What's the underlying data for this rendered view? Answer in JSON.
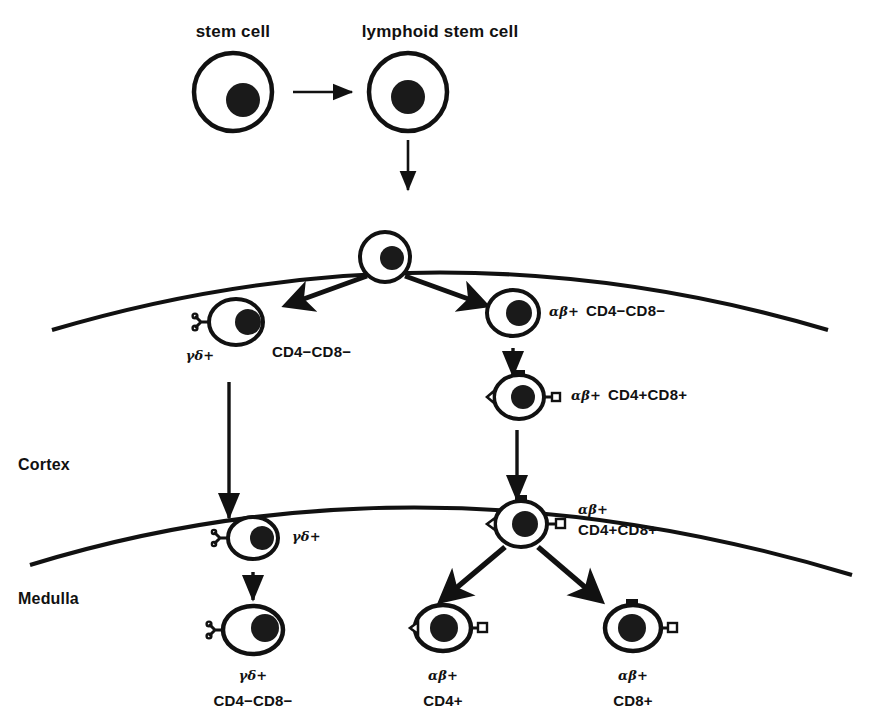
{
  "figure": {
    "title_top_left": "stem cell",
    "title_top_right": "lymphoid stem cell",
    "regions": {
      "cortex": "Cortex",
      "medulla": "Medulla"
    }
  },
  "cells": {
    "stem_cell": {
      "label": "stem cell",
      "markers": []
    },
    "lymphoid_stem_cell": {
      "label": "lymphoid stem cell",
      "markers": []
    },
    "thymic_progenitor": {
      "label": "",
      "markers": []
    },
    "cortex_gd": {
      "receptor": "γδ+",
      "phenotype": "CD4−CD8−"
    },
    "cortex_ab_dn": {
      "receptor": "αβ+",
      "phenotype": "CD4−CD8−"
    },
    "cortex_ab_dp": {
      "receptor": "αβ+",
      "phenotype": "CD4+CD8+"
    },
    "medulla_gd": {
      "receptor": "γδ+",
      "phenotype": ""
    },
    "medulla_ab_dp": {
      "receptor": "αβ+",
      "phenotype": "CD4+CD8+"
    },
    "final_gd": {
      "receptor": "γδ+",
      "phenotype": "CD4−CD8−"
    },
    "final_cd4": {
      "receptor": "αβ+",
      "phenotype": "CD4+"
    },
    "final_cd8": {
      "receptor": "αβ+",
      "phenotype": "CD8+"
    }
  },
  "colors": {
    "ink": "#111111",
    "background": "#ffffff"
  }
}
